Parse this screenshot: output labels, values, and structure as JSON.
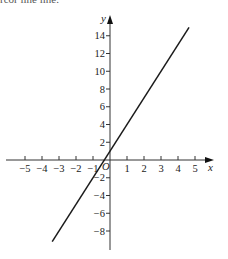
{
  "header": {
    "clipped_text": "rcor line line."
  },
  "chart_data": {
    "type": "line",
    "title": "",
    "xlabel": "x",
    "ylabel": "y",
    "origin_label": "O",
    "xlim": [
      -5.9,
      6
    ],
    "ylim": [
      -10,
      16
    ],
    "grid": false,
    "legend": null,
    "x_ticks": [
      -5,
      -4,
      -3,
      -2,
      -1,
      1,
      2,
      3,
      4,
      5
    ],
    "x_tick_labels": [
      "−5",
      "−4",
      "−3",
      "−2",
      "−1",
      "1",
      "2",
      "3",
      "4",
      "5"
    ],
    "y_ticks": [
      14,
      12,
      10,
      8,
      6,
      4,
      2,
      -2,
      -4,
      -6,
      -8
    ],
    "y_tick_labels": [
      "14",
      "12",
      "10",
      "8",
      "6",
      "4",
      "2",
      "−2",
      "−4",
      "−6",
      "−8"
    ],
    "series": [
      {
        "name": "y = 3x + 1",
        "equation": "y = 3x + 1",
        "x": [
          -3.4,
          4.65
        ],
        "y": [
          -9.2,
          14.95
        ],
        "color": "#1a1a1a"
      }
    ]
  }
}
